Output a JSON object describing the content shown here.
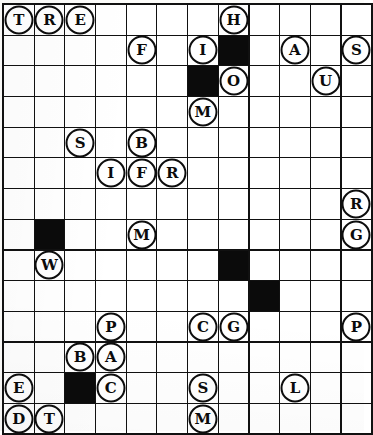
{
  "puzzle": {
    "type": "letter-tile-grid",
    "columns": 12,
    "rows": 14,
    "cell_size_px": 29.5,
    "colors": {
      "grid_line": "#111111",
      "block_fill": "#0b0b0b",
      "cell_fill": "#ffffff",
      "token_outline": "#0d0d0d",
      "token_text": "#0b0b0b"
    },
    "legend": {
      "block": "blocked square (solid black)",
      "token": "circled letter tile placed on a square",
      "empty": "open square"
    },
    "cells": [
      [
        {
          "kind": "token",
          "letter": "T"
        },
        {
          "kind": "token",
          "letter": "R"
        },
        {
          "kind": "token",
          "letter": "E"
        },
        {
          "kind": "empty",
          "letter": ""
        },
        {
          "kind": "empty",
          "letter": ""
        },
        {
          "kind": "empty",
          "letter": ""
        },
        {
          "kind": "empty",
          "letter": ""
        },
        {
          "kind": "token",
          "letter": "H"
        },
        {
          "kind": "empty",
          "letter": ""
        },
        {
          "kind": "empty",
          "letter": ""
        },
        {
          "kind": "empty",
          "letter": ""
        },
        {
          "kind": "empty",
          "letter": ""
        }
      ],
      [
        {
          "kind": "empty",
          "letter": ""
        },
        {
          "kind": "empty",
          "letter": ""
        },
        {
          "kind": "empty",
          "letter": ""
        },
        {
          "kind": "empty",
          "letter": ""
        },
        {
          "kind": "token",
          "letter": "F"
        },
        {
          "kind": "empty",
          "letter": ""
        },
        {
          "kind": "token",
          "letter": "I"
        },
        {
          "kind": "block",
          "letter": ""
        },
        {
          "kind": "empty",
          "letter": ""
        },
        {
          "kind": "token",
          "letter": "A"
        },
        {
          "kind": "empty",
          "letter": ""
        },
        {
          "kind": "token",
          "letter": "S"
        }
      ],
      [
        {
          "kind": "empty",
          "letter": ""
        },
        {
          "kind": "empty",
          "letter": ""
        },
        {
          "kind": "empty",
          "letter": ""
        },
        {
          "kind": "empty",
          "letter": ""
        },
        {
          "kind": "empty",
          "letter": ""
        },
        {
          "kind": "empty",
          "letter": ""
        },
        {
          "kind": "block",
          "letter": ""
        },
        {
          "kind": "token",
          "letter": "O"
        },
        {
          "kind": "empty",
          "letter": ""
        },
        {
          "kind": "empty",
          "letter": ""
        },
        {
          "kind": "token",
          "letter": "U"
        },
        {
          "kind": "empty",
          "letter": ""
        }
      ],
      [
        {
          "kind": "empty",
          "letter": ""
        },
        {
          "kind": "empty",
          "letter": ""
        },
        {
          "kind": "empty",
          "letter": ""
        },
        {
          "kind": "empty",
          "letter": ""
        },
        {
          "kind": "empty",
          "letter": ""
        },
        {
          "kind": "empty",
          "letter": ""
        },
        {
          "kind": "token",
          "letter": "M"
        },
        {
          "kind": "empty",
          "letter": ""
        },
        {
          "kind": "empty",
          "letter": ""
        },
        {
          "kind": "empty",
          "letter": ""
        },
        {
          "kind": "empty",
          "letter": ""
        },
        {
          "kind": "empty",
          "letter": ""
        }
      ],
      [
        {
          "kind": "empty",
          "letter": ""
        },
        {
          "kind": "empty",
          "letter": ""
        },
        {
          "kind": "token",
          "letter": "S"
        },
        {
          "kind": "empty",
          "letter": ""
        },
        {
          "kind": "token",
          "letter": "B"
        },
        {
          "kind": "empty",
          "letter": ""
        },
        {
          "kind": "empty",
          "letter": ""
        },
        {
          "kind": "empty",
          "letter": ""
        },
        {
          "kind": "empty",
          "letter": ""
        },
        {
          "kind": "empty",
          "letter": ""
        },
        {
          "kind": "empty",
          "letter": ""
        },
        {
          "kind": "empty",
          "letter": ""
        }
      ],
      [
        {
          "kind": "empty",
          "letter": ""
        },
        {
          "kind": "empty",
          "letter": ""
        },
        {
          "kind": "empty",
          "letter": ""
        },
        {
          "kind": "token",
          "letter": "I"
        },
        {
          "kind": "token",
          "letter": "F"
        },
        {
          "kind": "token",
          "letter": "R"
        },
        {
          "kind": "empty",
          "letter": ""
        },
        {
          "kind": "empty",
          "letter": ""
        },
        {
          "kind": "empty",
          "letter": ""
        },
        {
          "kind": "empty",
          "letter": ""
        },
        {
          "kind": "empty",
          "letter": ""
        },
        {
          "kind": "empty",
          "letter": ""
        }
      ],
      [
        {
          "kind": "empty",
          "letter": ""
        },
        {
          "kind": "empty",
          "letter": ""
        },
        {
          "kind": "empty",
          "letter": ""
        },
        {
          "kind": "empty",
          "letter": ""
        },
        {
          "kind": "empty",
          "letter": ""
        },
        {
          "kind": "empty",
          "letter": ""
        },
        {
          "kind": "empty",
          "letter": ""
        },
        {
          "kind": "empty",
          "letter": ""
        },
        {
          "kind": "empty",
          "letter": ""
        },
        {
          "kind": "empty",
          "letter": ""
        },
        {
          "kind": "empty",
          "letter": ""
        },
        {
          "kind": "token",
          "letter": "R"
        }
      ],
      [
        {
          "kind": "empty",
          "letter": ""
        },
        {
          "kind": "block",
          "letter": ""
        },
        {
          "kind": "empty",
          "letter": ""
        },
        {
          "kind": "empty",
          "letter": ""
        },
        {
          "kind": "token",
          "letter": "M"
        },
        {
          "kind": "empty",
          "letter": ""
        },
        {
          "kind": "empty",
          "letter": ""
        },
        {
          "kind": "empty",
          "letter": ""
        },
        {
          "kind": "empty",
          "letter": ""
        },
        {
          "kind": "empty",
          "letter": ""
        },
        {
          "kind": "empty",
          "letter": ""
        },
        {
          "kind": "token",
          "letter": "G"
        }
      ],
      [
        {
          "kind": "empty",
          "letter": ""
        },
        {
          "kind": "token",
          "letter": "W"
        },
        {
          "kind": "empty",
          "letter": ""
        },
        {
          "kind": "empty",
          "letter": ""
        },
        {
          "kind": "empty",
          "letter": ""
        },
        {
          "kind": "empty",
          "letter": ""
        },
        {
          "kind": "empty",
          "letter": ""
        },
        {
          "kind": "block",
          "letter": ""
        },
        {
          "kind": "empty",
          "letter": ""
        },
        {
          "kind": "empty",
          "letter": ""
        },
        {
          "kind": "empty",
          "letter": ""
        },
        {
          "kind": "empty",
          "letter": ""
        }
      ],
      [
        {
          "kind": "empty",
          "letter": ""
        },
        {
          "kind": "empty",
          "letter": ""
        },
        {
          "kind": "empty",
          "letter": ""
        },
        {
          "kind": "empty",
          "letter": ""
        },
        {
          "kind": "empty",
          "letter": ""
        },
        {
          "kind": "empty",
          "letter": ""
        },
        {
          "kind": "empty",
          "letter": ""
        },
        {
          "kind": "empty",
          "letter": ""
        },
        {
          "kind": "block",
          "letter": ""
        },
        {
          "kind": "empty",
          "letter": ""
        },
        {
          "kind": "empty",
          "letter": ""
        },
        {
          "kind": "empty",
          "letter": ""
        }
      ],
      [
        {
          "kind": "empty",
          "letter": ""
        },
        {
          "kind": "empty",
          "letter": ""
        },
        {
          "kind": "empty",
          "letter": ""
        },
        {
          "kind": "token",
          "letter": "P"
        },
        {
          "kind": "empty",
          "letter": ""
        },
        {
          "kind": "empty",
          "letter": ""
        },
        {
          "kind": "token",
          "letter": "C"
        },
        {
          "kind": "token",
          "letter": "G"
        },
        {
          "kind": "empty",
          "letter": ""
        },
        {
          "kind": "empty",
          "letter": ""
        },
        {
          "kind": "empty",
          "letter": ""
        },
        {
          "kind": "token",
          "letter": "P"
        }
      ],
      [
        {
          "kind": "empty",
          "letter": ""
        },
        {
          "kind": "empty",
          "letter": ""
        },
        {
          "kind": "token",
          "letter": "B"
        },
        {
          "kind": "token",
          "letter": "A"
        },
        {
          "kind": "empty",
          "letter": ""
        },
        {
          "kind": "empty",
          "letter": ""
        },
        {
          "kind": "empty",
          "letter": ""
        },
        {
          "kind": "empty",
          "letter": ""
        },
        {
          "kind": "empty",
          "letter": ""
        },
        {
          "kind": "empty",
          "letter": ""
        },
        {
          "kind": "empty",
          "letter": ""
        },
        {
          "kind": "empty",
          "letter": ""
        }
      ],
      [
        {
          "kind": "token",
          "letter": "E"
        },
        {
          "kind": "empty",
          "letter": ""
        },
        {
          "kind": "block",
          "letter": ""
        },
        {
          "kind": "token",
          "letter": "C"
        },
        {
          "kind": "empty",
          "letter": ""
        },
        {
          "kind": "empty",
          "letter": ""
        },
        {
          "kind": "token",
          "letter": "S"
        },
        {
          "kind": "empty",
          "letter": ""
        },
        {
          "kind": "empty",
          "letter": ""
        },
        {
          "kind": "token",
          "letter": "L"
        },
        {
          "kind": "empty",
          "letter": ""
        },
        {
          "kind": "empty",
          "letter": ""
        }
      ],
      [
        {
          "kind": "token",
          "letter": "D"
        },
        {
          "kind": "token",
          "letter": "T"
        },
        {
          "kind": "empty",
          "letter": ""
        },
        {
          "kind": "empty",
          "letter": ""
        },
        {
          "kind": "empty",
          "letter": ""
        },
        {
          "kind": "empty",
          "letter": ""
        },
        {
          "kind": "token",
          "letter": "M"
        },
        {
          "kind": "empty",
          "letter": ""
        },
        {
          "kind": "empty",
          "letter": ""
        },
        {
          "kind": "empty",
          "letter": ""
        },
        {
          "kind": "empty",
          "letter": ""
        },
        {
          "kind": "empty",
          "letter": ""
        }
      ]
    ]
  }
}
